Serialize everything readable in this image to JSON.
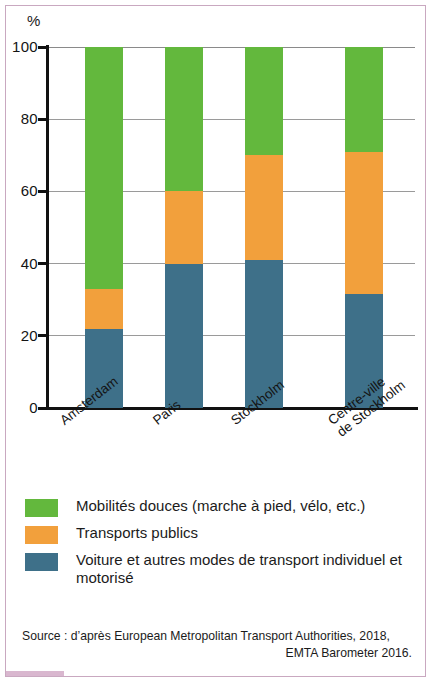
{
  "chart_data": {
    "type": "bar",
    "subtype": "stacked-percentage",
    "title": "",
    "xlabel": "",
    "ylabel": "%",
    "ylim": [
      0,
      100
    ],
    "yticks": [
      0,
      20,
      40,
      60,
      80,
      100
    ],
    "ytick_labels": [
      "0",
      "20",
      "40",
      "60",
      "80",
      "100"
    ],
    "grid": true,
    "legend_position": "bottom",
    "categories": [
      "Amsterdam",
      "Paris",
      "Stockholm",
      "Centre-ville de Stockholm"
    ],
    "category_labels": [
      {
        "lines": [
          "Amsterdam"
        ]
      },
      {
        "lines": [
          "Paris"
        ]
      },
      {
        "lines": [
          "Stockholm"
        ]
      },
      {
        "lines": [
          "Centre-ville",
          "de Stockholm"
        ]
      }
    ],
    "series": [
      {
        "name": "Voiture et autres modes de transport individuel et motorisé",
        "color": "#3e7089",
        "values": [
          22,
          40,
          41,
          31.5
        ]
      },
      {
        "name": "Transports publics",
        "color": "#f2a03c",
        "values": [
          11,
          20,
          29,
          39.5
        ]
      },
      {
        "name": "Mobilités douces (marche à pied, vélo, etc.)",
        "color": "#63b83d",
        "values": [
          67,
          40,
          30,
          29
        ]
      }
    ],
    "cumulative_tops": {
      "Amsterdam": {
        "voiture": 22,
        "plus_transports": 33,
        "total": 100
      },
      "Paris": {
        "voiture": 40,
        "plus_transports": 60,
        "total": 100
      },
      "Stockholm": {
        "voiture": 41,
        "plus_transports": 70,
        "total": 100
      },
      "Centre-ville de Stockholm": {
        "voiture": 31.5,
        "plus_transports": 71,
        "total": 100
      }
    }
  },
  "axis": {
    "y_unit": "%"
  },
  "legend": {
    "items": [
      {
        "label": "Mobilités douces (marche à pied, vélo, etc.)",
        "color": "#63b83d"
      },
      {
        "label": "Transports publics",
        "color": "#f2a03c"
      },
      {
        "label": "Voiture et autres modes de transport individuel et motorisé",
        "color": "#3e7089"
      }
    ]
  },
  "source": {
    "line1": "Source : d’après European Metropolitan Transport Authorities, 2018,",
    "line2": "EMTA Barometer 2016."
  },
  "colors": {
    "green": "#63b83d",
    "orange": "#f2a03c",
    "blue": "#3e7089",
    "frame": "#c9a8c0",
    "axis": "#111111",
    "grid": "#9a9a9a"
  }
}
